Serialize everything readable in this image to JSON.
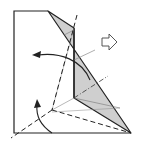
{
  "diagram": {
    "colors": {
      "paper": "#ffffff",
      "flap": "#cfcfcf",
      "line": "#222222",
      "thin_line": "#888888"
    },
    "elements": {
      "paper_outline": "paper-square",
      "flap": "folded-flap",
      "valley_folds": [
        "diagonal-valley-fold",
        "bottom-valley-fold",
        "lower-left-valley-fold",
        "upper-valley-fold"
      ],
      "arrows": [
        "fold-back-arrow-top",
        "fold-up-arrow-bottom",
        "turn-over-arrow"
      ]
    }
  }
}
